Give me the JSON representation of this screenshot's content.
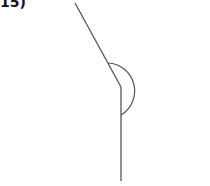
{
  "figure": {
    "label": "15)",
    "stroke_color": "#555555"
  }
}
